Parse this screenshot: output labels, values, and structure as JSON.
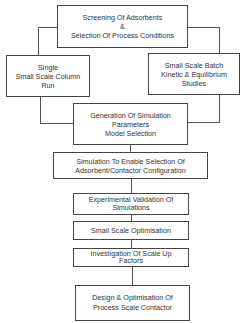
{
  "diagram": {
    "type": "flowchart",
    "nodes": [
      {
        "id": "screening",
        "lines": [
          "Screening Of Adsorbents",
          "&",
          "Selection Of Process Conditions"
        ]
      },
      {
        "id": "single_column",
        "lines": [
          "Single",
          "Small Scale Column",
          "Run"
        ]
      },
      {
        "id": "batch_studies",
        "lines": [
          "Small Scale Batch",
          "Kinetic & Equilibrium",
          "Studies"
        ]
      },
      {
        "id": "generation",
        "lines": [
          "Generation Of Simulation",
          "Parameters",
          "Model Selection"
        ]
      },
      {
        "id": "simulation",
        "lines": [
          "Simulation To Enable Selection Of",
          "Adsorbent/Contactor Configuration"
        ]
      },
      {
        "id": "validation",
        "lines": [
          "Experimental Validation Of",
          "Simulations"
        ]
      },
      {
        "id": "optimisation",
        "lines": [
          "Small Scale Optimisation"
        ]
      },
      {
        "id": "scale_up",
        "lines": [
          "Investigation Of Scale Up",
          "Factors"
        ]
      },
      {
        "id": "design",
        "lines": [
          "Design & Optimisation Of",
          "Process Scale Contactor"
        ]
      }
    ],
    "edges": [
      [
        "screening",
        "single_column"
      ],
      [
        "screening",
        "batch_studies"
      ],
      [
        "single_column",
        "generation"
      ],
      [
        "batch_studies",
        "generation"
      ],
      [
        "generation",
        "simulation"
      ],
      [
        "simulation",
        "validation"
      ],
      [
        "validation",
        "optimisation"
      ],
      [
        "optimisation",
        "scale_up"
      ],
      [
        "scale_up",
        "design"
      ]
    ]
  }
}
